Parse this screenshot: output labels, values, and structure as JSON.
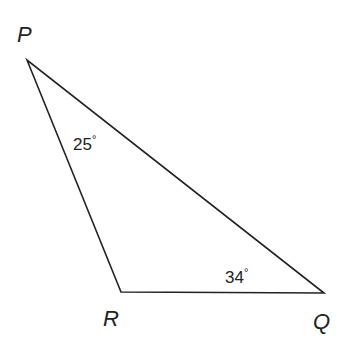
{
  "diagram": {
    "vertices": {
      "P": {
        "label": "P",
        "x": 27,
        "y": 60
      },
      "R": {
        "label": "R",
        "x": 121,
        "y": 292
      },
      "Q": {
        "label": "Q",
        "x": 324,
        "y": 293
      }
    },
    "angles": {
      "P": {
        "value": "25",
        "unit": "°"
      },
      "Q": {
        "value": "34",
        "unit": "°"
      }
    },
    "stroke_color": "#222222"
  }
}
